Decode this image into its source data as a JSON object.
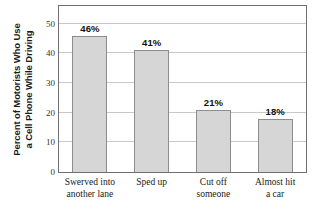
{
  "chart_data": {
    "type": "bar",
    "title": "",
    "subtitle": "",
    "xlabel": "",
    "ylabel": "Percent of Motorists Who Use a Cell Phone While Driving",
    "ylabel_lines": [
      "Percent of Motorists Who Use",
      "a Cell Phone While Driving"
    ],
    "categories": [
      "Swerved into another lane",
      "Sped up",
      "Cut off someone",
      "Almost hit a car"
    ],
    "category_lines": [
      [
        "Swerved into",
        "another lane"
      ],
      [
        "Sped up",
        ""
      ],
      [
        "Cut off",
        "someone"
      ],
      [
        "Almost hit",
        "a car"
      ]
    ],
    "values": [
      46,
      41,
      21,
      18
    ],
    "value_labels": [
      "46%",
      "41%",
      "21%",
      "18%"
    ],
    "ylim": [
      0,
      56
    ],
    "yticks": [
      0,
      10,
      20,
      30,
      40,
      50
    ],
    "ytick_labels": [
      "0",
      "10",
      "20",
      "30",
      "40",
      "50"
    ],
    "grid": true,
    "grid_axis": "y",
    "legend": false,
    "legend_position": "none",
    "colors": {
      "bar_fill": "#d6d6d6",
      "bar_stroke": "#8d8d8d",
      "gridline": "#c9c9c9",
      "frame": "#6f6f6f",
      "text": "#1a1a1a",
      "plot_background": "#ffffff"
    }
  }
}
